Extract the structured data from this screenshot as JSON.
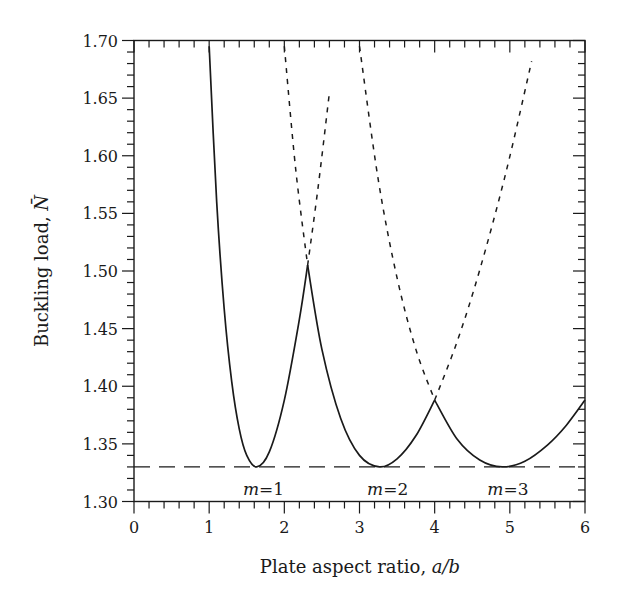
{
  "chart_data": {
    "type": "line",
    "title": "",
    "xlabel_text": "Plate aspect ratio, ",
    "xlabel_italic": "a/b",
    "ylabel_text": "Buckling load, ",
    "ylabel_symbol": "N̄",
    "xlim": [
      0,
      6
    ],
    "ylim": [
      1.3,
      1.7
    ],
    "x_ticks": [
      0,
      1,
      2,
      3,
      4,
      5,
      6
    ],
    "x_tick_labels": [
      "0",
      "1",
      "2",
      "3",
      "4",
      "5",
      "6"
    ],
    "x_minor_step": 0.2,
    "y_ticks": [
      1.3,
      1.35,
      1.4,
      1.45,
      1.5,
      1.55,
      1.6,
      1.65,
      1.7
    ],
    "y_tick_labels": [
      "1.30",
      "1.35",
      "1.40",
      "1.45",
      "1.50",
      "1.55",
      "1.60",
      "1.65",
      "1.70"
    ],
    "y_minor_step": 0.01,
    "grid": false,
    "reference_line": {
      "name": "minimum-buckling-load",
      "y": 1.33,
      "style": "dashed"
    },
    "series": [
      {
        "name": "m=1",
        "label": "m=1",
        "label_x": 1.45,
        "solid": [
          [
            1.0,
            1.695
          ],
          [
            1.1,
            1.56
          ],
          [
            1.2,
            1.467
          ],
          [
            1.3,
            1.404
          ],
          [
            1.4,
            1.363
          ],
          [
            1.5,
            1.34
          ],
          [
            1.633,
            1.33
          ],
          [
            1.8,
            1.343
          ],
          [
            2.0,
            1.388
          ],
          [
            2.2,
            1.458
          ],
          [
            2.31,
            1.505
          ]
        ],
        "dashed": [
          [
            2.31,
            1.505
          ],
          [
            2.45,
            1.573
          ],
          [
            2.6,
            1.655
          ]
        ]
      },
      {
        "name": "m=2",
        "label": "m=2",
        "label_x": 3.1,
        "solid": [
          [
            2.31,
            1.505
          ],
          [
            2.5,
            1.432
          ],
          [
            2.75,
            1.372
          ],
          [
            3.0,
            1.34
          ],
          [
            3.266,
            1.33
          ],
          [
            3.5,
            1.337
          ],
          [
            3.75,
            1.357
          ],
          [
            4.0,
            1.388
          ]
        ],
        "dashed_before": [
          [
            2.0,
            1.695
          ],
          [
            2.15,
            1.589
          ],
          [
            2.31,
            1.505
          ]
        ],
        "dashed": [
          [
            4.0,
            1.388
          ],
          [
            4.3,
            1.439
          ],
          [
            4.6,
            1.501
          ],
          [
            4.95,
            1.586
          ],
          [
            5.29,
            1.682
          ]
        ]
      },
      {
        "name": "m=3",
        "label": "m=3",
        "label_x": 4.7,
        "solid": [
          [
            4.0,
            1.388
          ],
          [
            4.3,
            1.354
          ],
          [
            4.6,
            1.336
          ],
          [
            4.899,
            1.33
          ],
          [
            5.2,
            1.335
          ],
          [
            5.5,
            1.349
          ],
          [
            5.75,
            1.366
          ],
          [
            6.0,
            1.388
          ]
        ],
        "dashed_before": [
          [
            3.0,
            1.695
          ],
          [
            3.25,
            1.579
          ],
          [
            3.5,
            1.494
          ],
          [
            3.75,
            1.432
          ],
          [
            4.0,
            1.388
          ]
        ]
      }
    ],
    "line_color": "#1a1a1a"
  }
}
